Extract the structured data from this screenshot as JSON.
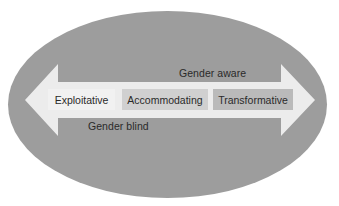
{
  "diagram": {
    "title": "",
    "background_ellipse": {
      "color": "#9d9d9d"
    },
    "arrow": {
      "direction": "bidirectional",
      "color": "#ececec"
    },
    "top_label": "Gender aware",
    "bottom_label": "Gender blind",
    "stages": [
      {
        "label": "Exploitative",
        "color": "#f1f1f1"
      },
      {
        "label": "Accommodating",
        "color": "#d0d0d0"
      },
      {
        "label": "Transformative",
        "color": "#bababa"
      }
    ]
  }
}
